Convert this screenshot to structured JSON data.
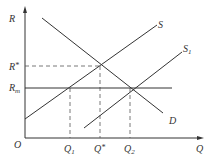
{
  "diagram": {
    "type": "supply-demand",
    "axes": {
      "y_label": "R",
      "x_label": "Q",
      "origin_label": "O"
    },
    "y_ticks": [
      {
        "main": "R",
        "suffix": "*",
        "y": 66
      },
      {
        "main": "R",
        "sub": "m",
        "y": 88
      }
    ],
    "x_ticks": [
      {
        "main": "Q",
        "sub": "1",
        "x": 70
      },
      {
        "main": "Q",
        "suffix": "*",
        "x": 100
      },
      {
        "main": "Q",
        "sub": "2",
        "x": 130
      }
    ],
    "curves": [
      {
        "name": "S",
        "label": "S"
      },
      {
        "name": "S1",
        "label": "S",
        "label_sub": "1"
      },
      {
        "name": "D",
        "label": "D"
      },
      {
        "name": "Rm-line",
        "label": ""
      }
    ],
    "colors": {
      "line": "#333333",
      "dashed": "#555555"
    }
  }
}
